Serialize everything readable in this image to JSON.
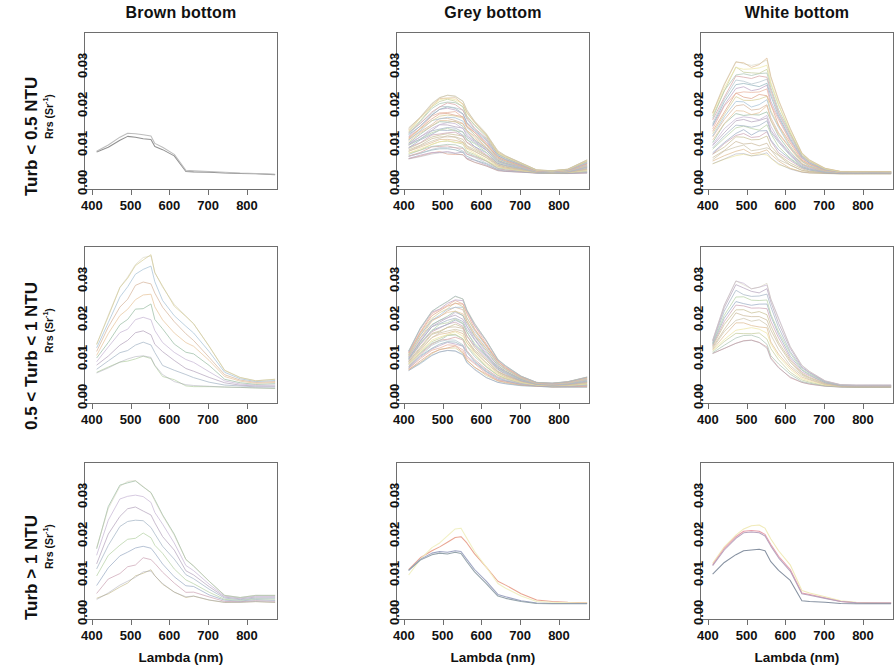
{
  "figure": {
    "kind": "multi-panel-line-chart",
    "rows": 3,
    "cols": 3,
    "column_titles": [
      "Brown bottom",
      "Grey bottom",
      "White bottom"
    ],
    "row_titles": [
      "Turb < 0.5 NTU",
      "0.5 < Turb < 1 NTU",
      "Turb > 1 NTU"
    ],
    "axis_label_x": "Lambda (nm)",
    "axis_label_y_base": "Rrs (Sr",
    "axis_label_y_exp": "-1",
    "axis_label_y_close": ")",
    "xticks": [
      "400",
      "500",
      "600",
      "700",
      "800"
    ],
    "yticks": [
      "0.00",
      "0.01",
      "0.02",
      "0.03"
    ],
    "xlim": [
      380,
      880
    ],
    "ylim": [
      -0.004,
      0.0365
    ],
    "grid": false,
    "legend": null
  },
  "chart_data": [
    {
      "type": "line",
      "panel": "r1c1",
      "title": "Brown bottom / Turb < 0.5 NTU",
      "xlabel": "Lambda (nm)",
      "ylabel": "Rrs (Sr-1)",
      "xlim": [
        380,
        880
      ],
      "ylim": [
        -0.004,
        0.0365
      ],
      "n_series": 2,
      "x": [
        410,
        440,
        470,
        490,
        510,
        530,
        550,
        560,
        580,
        610,
        640,
        660,
        700,
        740,
        780,
        820,
        870
      ],
      "series": [
        {
          "name": "spec-1",
          "color": "#8a8a8a",
          "values": [
            0.006,
            0.0072,
            0.009,
            0.01,
            0.0098,
            0.0094,
            0.0092,
            0.0074,
            0.0066,
            0.005,
            0.001,
            0.0009,
            0.0008,
            0.0006,
            0.0005,
            0.0004,
            0.0002
          ]
        },
        {
          "name": "spec-2",
          "color": "#b9b9b9",
          "values": [
            0.0062,
            0.0078,
            0.0098,
            0.0108,
            0.0107,
            0.0104,
            0.0101,
            0.0082,
            0.0072,
            0.0054,
            0.0013,
            0.0012,
            0.001,
            0.0008,
            0.0006,
            0.0005,
            0.0003
          ]
        }
      ]
    },
    {
      "type": "line",
      "panel": "r1c2",
      "title": "Grey bottom / Turb < 0.5 NTU",
      "xlabel": "Lambda (nm)",
      "ylabel": "Rrs (Sr-1)",
      "xlim": [
        380,
        880
      ],
      "ylim": [
        -0.004,
        0.0365
      ],
      "n_series": 34,
      "note": "dense bundle of spectra peaking 0.006-0.021 near 490-530 nm, converging near 0.000-0.003 beyond 750 nm with a slight up-tick to 0.004 at 870 nm",
      "envelope_min": [
        0.0042,
        0.0048,
        0.0055,
        0.0058,
        0.0058,
        0.0056,
        0.0052,
        0.0042,
        0.0034,
        0.0024,
        0.0012,
        0.001,
        0.0008,
        0.0006,
        0.0005,
        0.0005,
        0.0006
      ],
      "envelope_max": [
        0.012,
        0.015,
        0.0185,
        0.02,
        0.0205,
        0.0202,
        0.019,
        0.0165,
        0.014,
        0.0108,
        0.0062,
        0.005,
        0.0032,
        0.0014,
        0.0012,
        0.0016,
        0.004
      ]
    },
    {
      "type": "line",
      "panel": "r1c3",
      "title": "White bottom / Turb < 0.5 NTU",
      "xlabel": "Lambda (nm)",
      "ylabel": "Rrs (Sr-1)",
      "xlim": [
        380,
        880
      ],
      "ylim": [
        -0.004,
        0.0365
      ],
      "n_series": 26,
      "note": "broad plateau between 470 and 560 nm, spectra spread 0.006-0.030, sharp fall after 580 nm, flat near 0.0005 past 700 nm",
      "envelope_min": [
        0.003,
        0.0042,
        0.0055,
        0.0056,
        0.005,
        0.0052,
        0.0058,
        0.0045,
        0.003,
        0.0016,
        0.0008,
        0.0006,
        0.0005,
        0.0004,
        0.0004,
        0.0004,
        0.0004
      ],
      "envelope_max": [
        0.016,
        0.0235,
        0.0292,
        0.0286,
        0.0282,
        0.0286,
        0.0296,
        0.025,
        0.019,
        0.012,
        0.0058,
        0.004,
        0.0018,
        0.001,
        0.001,
        0.001,
        0.001
      ]
    },
    {
      "type": "line",
      "panel": "r2c1",
      "title": "Brown bottom / 0.5 < Turb < 1 NTU",
      "xlabel": "Lambda (nm)",
      "ylabel": "Rrs (Sr-1)",
      "xlim": [
        380,
        880
      ],
      "ylim": [
        -0.004,
        0.0365
      ],
      "n_series": 9,
      "note": "two high pale-yellow spectra peak 0.028 and 0.034 near 545-560 nm; remaining cluster peaks 0.009-0.015 near 520-545 nm",
      "envelope_min": [
        0.0042,
        0.0055,
        0.007,
        0.0078,
        0.0084,
        0.0086,
        0.0082,
        0.0062,
        0.0038,
        0.002,
        0.0012,
        0.001,
        0.0008,
        0.0006,
        0.0005,
        0.0004,
        0.0003
      ],
      "envelope_max": [
        0.0115,
        0.019,
        0.0262,
        0.0288,
        0.032,
        0.0338,
        0.0342,
        0.03,
        0.0262,
        0.0218,
        0.0188,
        0.0168,
        0.011,
        0.0048,
        0.003,
        0.0022,
        0.0026
      ]
    },
    {
      "type": "line",
      "panel": "r2c2",
      "title": "Grey bottom / 0.5 < Turb < 1 NTU",
      "xlabel": "Lambda (nm)",
      "ylabel": "Rrs (Sr-1)",
      "xlim": [
        380,
        880
      ],
      "ylim": [
        -0.004,
        0.0365
      ],
      "n_series": 30,
      "note": "dense bundle peaking 0.011-0.024 between 500 and 545 nm, decaying to below 0.002 beyond 700 nm",
      "envelope_min": [
        0.0048,
        0.0068,
        0.0088,
        0.0096,
        0.01,
        0.0098,
        0.0088,
        0.007,
        0.005,
        0.003,
        0.0018,
        0.0015,
        0.001,
        0.0008,
        0.0006,
        0.0006,
        0.0006
      ],
      "envelope_max": [
        0.0098,
        0.0155,
        0.02,
        0.0212,
        0.0225,
        0.0238,
        0.0232,
        0.0205,
        0.017,
        0.0125,
        0.0078,
        0.006,
        0.0034,
        0.0018,
        0.0016,
        0.002,
        0.0032
      ]
    },
    {
      "type": "line",
      "panel": "r2c3",
      "title": "White bottom / 0.5 < Turb < 1 NTU",
      "xlabel": "Lambda (nm)",
      "ylabel": "Rrs (Sr-1)",
      "xlim": [
        380,
        880
      ],
      "ylim": [
        -0.004,
        0.0365
      ],
      "n_series": 14,
      "note": "peaks 0.013-0.028 near 470-545 nm; one spectrum dips at 540 then spikes to 0.027 at 555 nm; all converge near 0.001 past 750 nm",
      "envelope_min": [
        0.0092,
        0.0105,
        0.0118,
        0.0124,
        0.0126,
        0.012,
        0.0105,
        0.0078,
        0.0055,
        0.0032,
        0.0018,
        0.0014,
        0.0008,
        0.0006,
        0.0005,
        0.0005,
        0.0005
      ],
      "envelope_max": [
        0.0125,
        0.0215,
        0.0278,
        0.0268,
        0.0258,
        0.0262,
        0.0272,
        0.0232,
        0.018,
        0.011,
        0.0062,
        0.0046,
        0.0022,
        0.0012,
        0.0011,
        0.0011,
        0.0011
      ]
    },
    {
      "type": "line",
      "panel": "r3c1",
      "title": "Brown bottom / Turb > 1 NTU",
      "xlabel": "Lambda (nm)",
      "ylabel": "Rrs (Sr-1)",
      "xlim": [
        380,
        880
      ],
      "ylim": [
        -0.004,
        0.0365
      ],
      "n_series": 8,
      "note": "two pale green-yellow spectra peak 0.030-0.032 near 500-520 nm; mid group peaks 0.015-0.018 at 540 nm; lowest peaks 0.009",
      "envelope_min": [
        0.0015,
        0.0032,
        0.0052,
        0.0062,
        0.0072,
        0.0086,
        0.0088,
        0.0076,
        0.0056,
        0.0034,
        0.0022,
        0.0024,
        0.0014,
        0.0008,
        0.0008,
        0.001,
        0.0008
      ],
      "envelope_max": [
        0.0148,
        0.0248,
        0.0305,
        0.0318,
        0.032,
        0.0305,
        0.0288,
        0.0268,
        0.023,
        0.018,
        0.0118,
        0.0102,
        0.0062,
        0.0026,
        0.002,
        0.0026,
        0.0026
      ]
    },
    {
      "type": "line",
      "panel": "r3c2",
      "title": "Grey bottom / Turb > 1 NTU",
      "xlabel": "Lambda (nm)",
      "ylabel": "Rrs (Sr-1)",
      "xlim": [
        380,
        880
      ],
      "ylim": [
        -0.004,
        0.0365
      ],
      "n_series": 4,
      "x": [
        410,
        440,
        470,
        490,
        510,
        530,
        545,
        560,
        580,
        610,
        640,
        660,
        700,
        740,
        780,
        820,
        870
      ],
      "series": [
        {
          "name": "spec-1",
          "color": "#e8a08c",
          "values": [
            0.0092,
            0.0122,
            0.014,
            0.015,
            0.0162,
            0.0174,
            0.0176,
            0.016,
            0.0132,
            0.0098,
            0.0062,
            0.0052,
            0.003,
            0.0014,
            0.001,
            0.0008,
            0.0007
          ]
        },
        {
          "name": "spec-2",
          "color": "#f0efc0",
          "values": [
            0.0078,
            0.0118,
            0.0148,
            0.016,
            0.0178,
            0.0196,
            0.0198,
            0.0172,
            0.0138,
            0.0098,
            0.0056,
            0.0044,
            0.0024,
            0.001,
            0.0008,
            0.0007,
            0.0006
          ]
        },
        {
          "name": "spec-3",
          "color": "#9aa0c0",
          "values": [
            0.009,
            0.0118,
            0.0134,
            0.0138,
            0.0136,
            0.014,
            0.0138,
            0.0118,
            0.0092,
            0.0062,
            0.0028,
            0.0022,
            0.0012,
            0.0006,
            0.0005,
            0.0005,
            0.0005
          ]
        },
        {
          "name": "spec-4",
          "color": "#8f9fa8",
          "values": [
            0.009,
            0.0116,
            0.013,
            0.0134,
            0.0132,
            0.0136,
            0.0133,
            0.0112,
            0.0086,
            0.0056,
            0.0024,
            0.0018,
            0.001,
            0.0005,
            0.0004,
            0.0004,
            0.0004
          ]
        }
      ]
    },
    {
      "type": "line",
      "panel": "r3c3",
      "title": "White bottom / Turb > 1 NTU",
      "xlabel": "Lambda (nm)",
      "ylabel": "Rrs (Sr-1)",
      "xlim": [
        380,
        880
      ],
      "ylim": [
        -0.004,
        0.0365
      ],
      "n_series": 4,
      "x": [
        410,
        440,
        470,
        490,
        510,
        530,
        545,
        560,
        580,
        610,
        640,
        660,
        700,
        740,
        780,
        820,
        870
      ],
      "series": [
        {
          "name": "spec-1",
          "color": "#efe9b4",
          "values": [
            0.0108,
            0.015,
            0.018,
            0.0196,
            0.0204,
            0.0206,
            0.0198,
            0.017,
            0.014,
            0.0104,
            0.0038,
            0.0032,
            0.0022,
            0.0012,
            0.0008,
            0.0007,
            0.0006
          ]
        },
        {
          "name": "spec-2",
          "color": "#e79aa6",
          "values": [
            0.0104,
            0.0146,
            0.0176,
            0.019,
            0.0192,
            0.019,
            0.0182,
            0.0156,
            0.0126,
            0.0092,
            0.0032,
            0.0028,
            0.0019,
            0.001,
            0.0007,
            0.0006,
            0.0006
          ]
        },
        {
          "name": "spec-3",
          "color": "#b4a0bc",
          "values": [
            0.0102,
            0.0142,
            0.0172,
            0.0186,
            0.0188,
            0.0186,
            0.0178,
            0.0152,
            0.0122,
            0.0088,
            0.003,
            0.0026,
            0.0018,
            0.001,
            0.0007,
            0.0006,
            0.0006
          ]
        },
        {
          "name": "spec-4",
          "color": "#7f8b9c",
          "values": [
            0.008,
            0.011,
            0.013,
            0.014,
            0.0142,
            0.0144,
            0.014,
            0.0112,
            0.009,
            0.0064,
            0.0012,
            0.001,
            0.0008,
            0.0005,
            0.0004,
            0.0004,
            0.0004
          ]
        }
      ]
    }
  ]
}
